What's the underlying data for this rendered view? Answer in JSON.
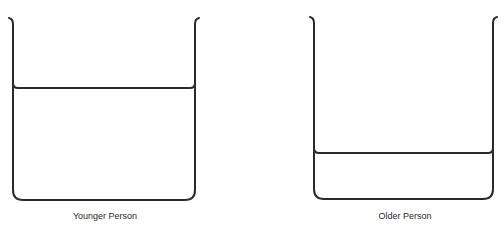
{
  "diagram": {
    "beakers": [
      {
        "id": "younger",
        "label": "Younger Person",
        "fill_level_fraction": 0.62
      },
      {
        "id": "older",
        "label": "Older Person",
        "fill_level_fraction": 0.25
      }
    ],
    "colors": {
      "stroke": "#2a2a2a",
      "background": "#ffffff"
    }
  }
}
